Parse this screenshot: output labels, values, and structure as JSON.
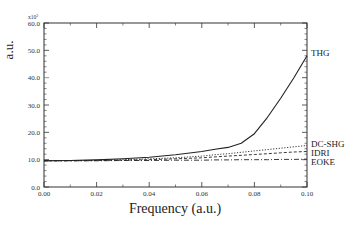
{
  "chart_data": {
    "type": "line",
    "title": "",
    "xlabel": "Frequency (a.u.)",
    "ylabel": "a.u.",
    "y_multiplier": "x10^2",
    "xlim": [
      0.0,
      0.1
    ],
    "ylim": [
      0.0,
      60.0
    ],
    "x_ticks": [
      "0.00",
      "0.02",
      "0.04",
      "0.06",
      "0.08",
      "0.10"
    ],
    "y_ticks": [
      "0.0",
      "10.0",
      "20.0",
      "30.0",
      "40.0",
      "50.0",
      "60.0"
    ],
    "grid": false,
    "legend_position": "inline-right",
    "x": [
      0.0,
      0.01,
      0.02,
      0.03,
      0.04,
      0.05,
      0.06,
      0.065,
      0.07,
      0.075,
      0.08,
      0.085,
      0.09,
      0.095,
      0.1
    ],
    "series": [
      {
        "name": "THG",
        "style": "solid",
        "values": [
          9.6,
          9.7,
          9.9,
          10.3,
          10.9,
          11.8,
          13.0,
          13.8,
          14.5,
          16.0,
          19.5,
          25.5,
          32.5,
          40.0,
          48.0
        ]
      },
      {
        "name": "DC-SHG",
        "style": "dotted",
        "values": [
          9.6,
          9.7,
          9.8,
          10.0,
          10.3,
          10.7,
          11.3,
          11.8,
          12.2,
          12.7,
          13.2,
          13.7,
          14.2,
          14.7,
          15.2
        ]
      },
      {
        "name": "IDRI",
        "style": "dashed",
        "values": [
          9.6,
          9.6,
          9.7,
          9.8,
          10.0,
          10.3,
          10.7,
          11.0,
          11.3,
          11.6,
          11.9,
          12.2,
          12.5,
          12.8,
          13.0
        ]
      },
      {
        "name": "EOKE",
        "style": "dashdot",
        "values": [
          9.6,
          9.6,
          9.6,
          9.7,
          9.7,
          9.8,
          9.8,
          9.9,
          9.9,
          10.0,
          10.0,
          10.0,
          10.1,
          10.1,
          10.2
        ]
      }
    ]
  },
  "labels": {
    "x_axis": "Frequency (a.u.)",
    "y_axis": "a.u.",
    "multiplier_base": "x10",
    "multiplier_exp": "2",
    "series_thg": "THG",
    "series_dcshg": "DC-SHG",
    "series_idri": "IDRI",
    "series_eoke": "EOKE"
  },
  "colors": {
    "axis": "#333333",
    "line": "#222222",
    "ylabel": "#2e5d4b",
    "accent_tick": "#3aa655"
  }
}
